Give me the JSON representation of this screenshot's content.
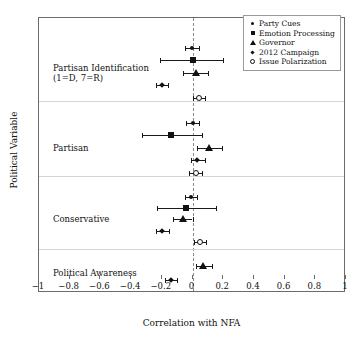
{
  "chart_data": {
    "type": "scatter",
    "title": "",
    "xlabel": "Correlation with NFA",
    "ylabel": "Political Variable",
    "xlim": [
      -1,
      1
    ],
    "grid": false,
    "legend_position": "top-right",
    "zero_reference_line": 0,
    "xticks": [
      -1,
      -0.8,
      -0.6,
      -0.4,
      -0.2,
      0,
      0.2,
      0.4,
      0.6,
      0.8,
      1
    ],
    "xticklabels": [
      "−1",
      "−0.8",
      "−0.6",
      "−0.4",
      "−0.2",
      "0",
      "0.2",
      "0.4",
      "0.6",
      "0.8",
      "1"
    ],
    "legend": [
      {
        "name": "Party Cues",
        "marker": "dot-marker"
      },
      {
        "name": "Emotion Processing",
        "marker": "square-marker"
      },
      {
        "name": "Governor",
        "marker": "triangle-marker"
      },
      {
        "name": "2012 Campaign",
        "marker": "diamond-marker"
      },
      {
        "name": "Issue Polarization",
        "marker": "open-circle-marker"
      }
    ],
    "groups": [
      {
        "label": "Partisan Identification\n(1=D, 7=R)",
        "points": [
          {
            "series": "Party Cues",
            "marker": "dot-marker",
            "value": -0.005,
            "ci_low": -0.05,
            "ci_high": 0.04
          },
          {
            "series": "Emotion Processing",
            "marker": "square-marker",
            "value": 0.0,
            "ci_low": -0.21,
            "ci_high": 0.2
          },
          {
            "series": "Governor",
            "marker": "triangle-marker",
            "value": 0.02,
            "ci_low": -0.06,
            "ci_high": 0.1
          },
          {
            "series": "2012 Campaign",
            "marker": "diamond-marker",
            "value": -0.2,
            "ci_low": -0.24,
            "ci_high": -0.16
          },
          {
            "series": "Issue Polarization",
            "marker": "open-circle-marker",
            "value": 0.04,
            "ci_low": 0.0,
            "ci_high": 0.08
          }
        ]
      },
      {
        "label": "Partisan",
        "points": [
          {
            "series": "Party Cues",
            "marker": "dot-marker",
            "value": 0.0,
            "ci_low": -0.04,
            "ci_high": 0.04
          },
          {
            "series": "Emotion Processing",
            "marker": "square-marker",
            "value": -0.14,
            "ci_low": -0.33,
            "ci_high": 0.06
          },
          {
            "series": "Governor",
            "marker": "triangle-marker",
            "value": 0.11,
            "ci_low": 0.03,
            "ci_high": 0.19
          },
          {
            "series": "2012 Campaign",
            "marker": "diamond-marker",
            "value": 0.03,
            "ci_low": -0.01,
            "ci_high": 0.08
          },
          {
            "series": "Issue Polarization",
            "marker": "open-circle-marker",
            "value": 0.02,
            "ci_low": -0.02,
            "ci_high": 0.06
          }
        ]
      },
      {
        "label": "Conservative",
        "points": [
          {
            "series": "Party Cues",
            "marker": "dot-marker",
            "value": -0.01,
            "ci_low": -0.05,
            "ci_high": 0.03
          },
          {
            "series": "Emotion Processing",
            "marker": "square-marker",
            "value": -0.04,
            "ci_low": -0.23,
            "ci_high": 0.15
          },
          {
            "series": "Governor",
            "marker": "triangle-marker",
            "value": -0.06,
            "ci_low": -0.13,
            "ci_high": 0.0
          },
          {
            "series": "2012 Campaign",
            "marker": "diamond-marker",
            "value": -0.2,
            "ci_low": -0.24,
            "ci_high": -0.15
          },
          {
            "series": "Issue Polarization",
            "marker": "open-circle-marker",
            "value": 0.05,
            "ci_low": 0.01,
            "ci_high": 0.09
          }
        ]
      },
      {
        "label": "Political Awareness",
        "points": [
          {
            "series": "Governor",
            "marker": "triangle-marker",
            "value": 0.07,
            "ci_low": 0.02,
            "ci_high": 0.13
          },
          {
            "series": "2012 Campaign",
            "marker": "diamond-marker",
            "value": -0.14,
            "ci_low": -0.18,
            "ci_high": -0.1
          }
        ]
      }
    ]
  }
}
